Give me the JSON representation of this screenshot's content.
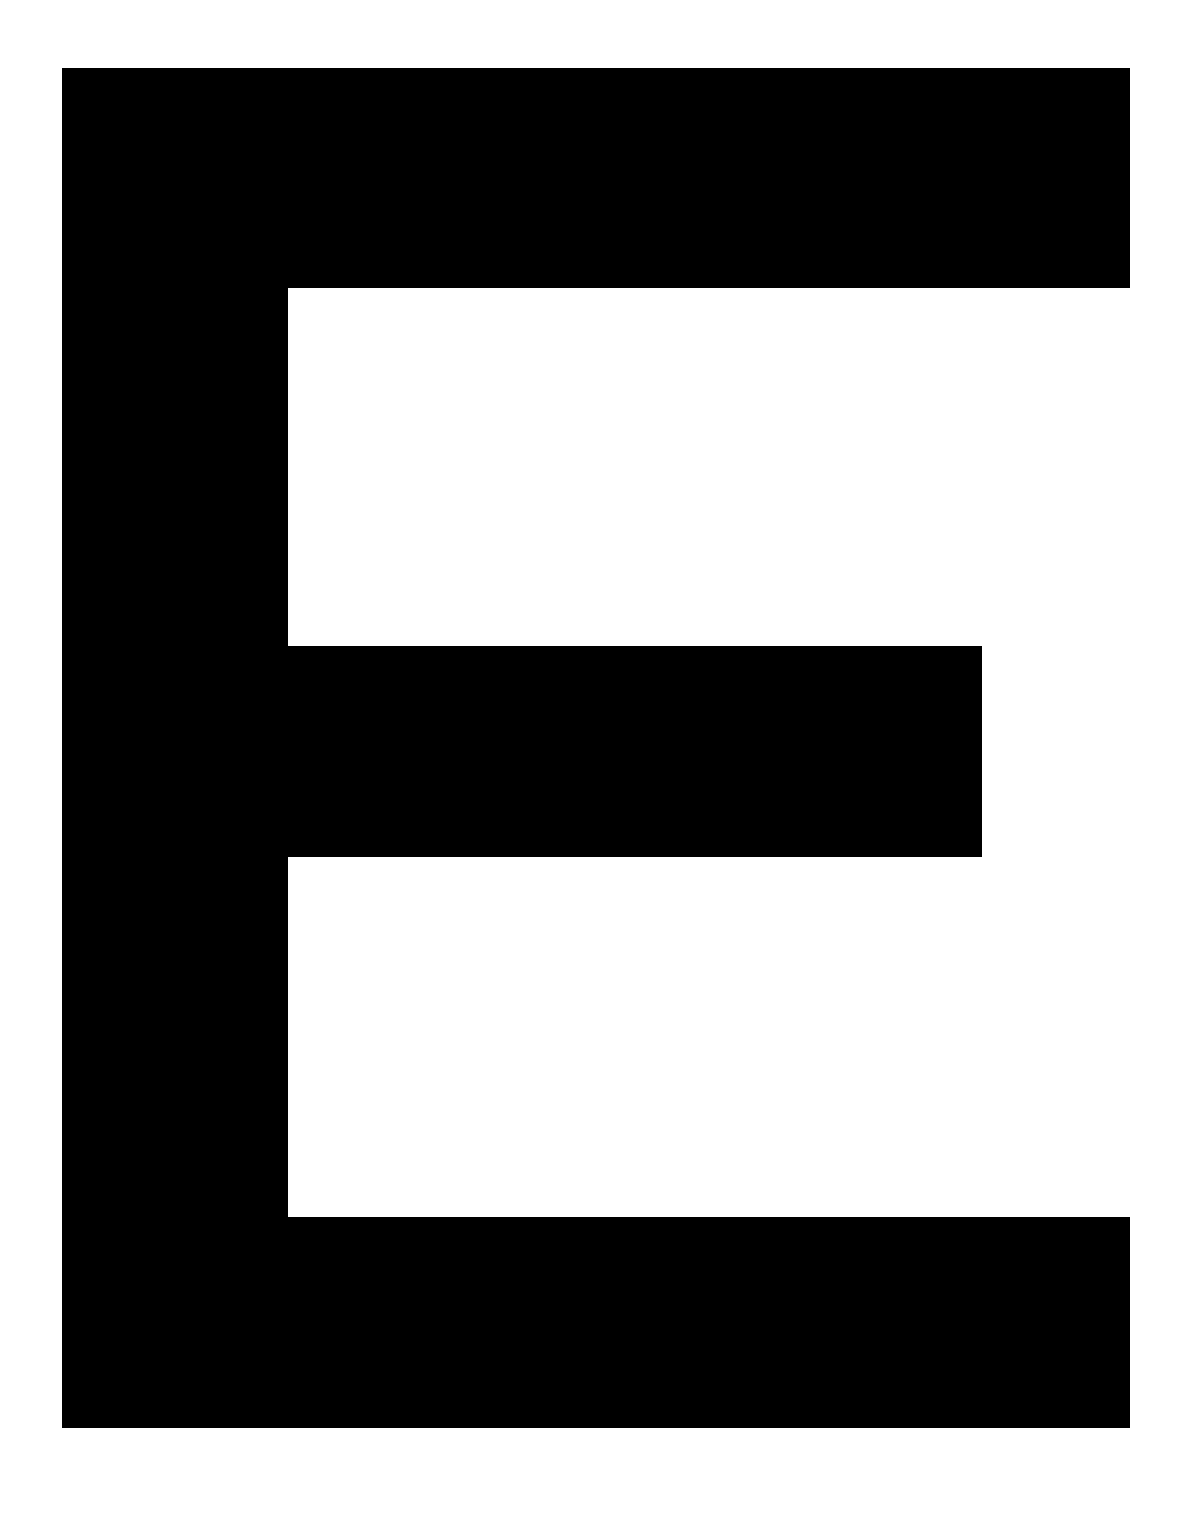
{
  "page": {
    "name": "letter-specimen-sheet",
    "width": 1185,
    "height": 1519,
    "background_color": "#ffffff",
    "glyph_color": "#000000",
    "character": "E",
    "character_name": "Latin Capital Letter E"
  },
  "glyph": {
    "character": "E",
    "fill_color": "#000000",
    "bounds": {
      "left": 62,
      "top": 68,
      "right": 1130,
      "bottom": 1428,
      "width": 1068,
      "height": 1360
    },
    "strokes": [
      {
        "name": "vertical-stem",
        "label": "Vertical stem",
        "x": 62,
        "y": 68,
        "width": 226,
        "height": 1360,
        "color": "#000000"
      },
      {
        "name": "top-arm",
        "label": "Top arm",
        "x": 62,
        "y": 68,
        "width": 1068,
        "height": 220,
        "color": "#000000"
      },
      {
        "name": "middle-arm",
        "label": "Middle arm",
        "x": 288,
        "y": 646,
        "width": 694,
        "height": 211,
        "color": "#000000"
      },
      {
        "name": "bottom-arm",
        "label": "Bottom arm",
        "x": 62,
        "y": 1217,
        "width": 1068,
        "height": 211,
        "color": "#000000"
      }
    ],
    "counters": [
      {
        "name": "upper-counter",
        "label": "Upper counter",
        "x": 288,
        "y": 288,
        "width": 897,
        "height": 358,
        "color": "#ffffff"
      },
      {
        "name": "lower-counter",
        "label": "Lower counter",
        "x": 288,
        "y": 857,
        "width": 897,
        "height": 360,
        "color": "#ffffff"
      }
    ]
  },
  "margins": {
    "left": 62,
    "top": 68,
    "right": 55,
    "bottom": 91
  }
}
